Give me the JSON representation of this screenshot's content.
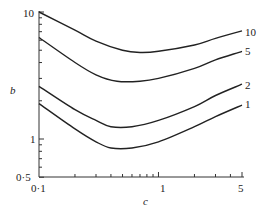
{
  "chart_data": {
    "type": "line",
    "title": "",
    "xlabel": "c",
    "ylabel": "b",
    "xscale": "log",
    "yscale": "log",
    "xlim": [
      0.1,
      5
    ],
    "ylim": [
      0.5,
      10
    ],
    "xticks": [
      "0·1",
      "1",
      "5"
    ],
    "yticks": [
      "0·5",
      "1",
      "10"
    ],
    "grid": false,
    "legend": "inline curve labels at right end",
    "series": [
      {
        "name": "10",
        "x": [
          0.1,
          0.2,
          0.3,
          0.5,
          0.7,
          1.0,
          2.0,
          3.0,
          5.0
        ],
        "y": [
          10.0,
          7.2,
          5.9,
          5.0,
          4.8,
          4.9,
          5.5,
          6.2,
          7.1
        ]
      },
      {
        "name": "5",
        "x": [
          0.1,
          0.2,
          0.3,
          0.45,
          0.7,
          1.0,
          2.0,
          3.0,
          5.0
        ],
        "y": [
          6.3,
          4.0,
          3.2,
          2.85,
          2.85,
          3.0,
          3.6,
          4.2,
          4.9
        ]
      },
      {
        "name": "2",
        "x": [
          0.1,
          0.2,
          0.3,
          0.4,
          0.6,
          1.0,
          2.0,
          3.0,
          5.0
        ],
        "y": [
          2.6,
          1.7,
          1.4,
          1.25,
          1.25,
          1.4,
          1.8,
          2.2,
          2.7
        ]
      },
      {
        "name": "1",
        "x": [
          0.1,
          0.2,
          0.3,
          0.4,
          0.6,
          1.0,
          2.0,
          3.0,
          5.0
        ],
        "y": [
          1.9,
          1.2,
          0.95,
          0.85,
          0.85,
          0.95,
          1.25,
          1.5,
          1.85
        ]
      }
    ]
  },
  "axes": {
    "x_label": "c",
    "y_label": "b",
    "x_tick_labels": {
      "t0": "0·1",
      "t1": "1",
      "t2": "5"
    },
    "y_tick_labels": {
      "t0": "0·5",
      "t1": "1",
      "t2": "10"
    }
  },
  "curve_labels": {
    "c10": "10",
    "c5": "5",
    "c2": "2",
    "c1": "1"
  }
}
